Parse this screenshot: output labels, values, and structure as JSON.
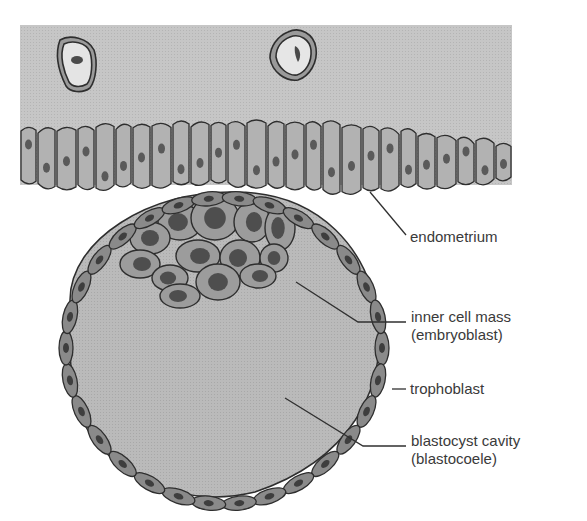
{
  "diagram": {
    "colors": {
      "background": "#ffffff",
      "uterine_lumen": "#c4c4c4",
      "epithelial_cell": "#b2b2b2",
      "cell_outline": "#2e2e2e",
      "nucleus": "#5a5a5a",
      "inner_cell": "#9c9c9c",
      "inner_nucleus": "#4e4e4e",
      "trophoblast_cell": "#8a8a8a",
      "cavity": "#b8b8b8",
      "leader_line": "#303030",
      "label_text": "#3a3a3a"
    },
    "labels": [
      {
        "id": "endometrium",
        "lines": [
          "endometrium"
        ]
      },
      {
        "id": "inner_cell_mass",
        "lines": [
          "inner cell mass",
          "(embryoblast)"
        ]
      },
      {
        "id": "trophoblast",
        "lines": [
          "trophoblast"
        ]
      },
      {
        "id": "blastocyst_cavity",
        "lines": [
          "blastocyst cavity",
          "(blastocoele)"
        ]
      }
    ]
  }
}
